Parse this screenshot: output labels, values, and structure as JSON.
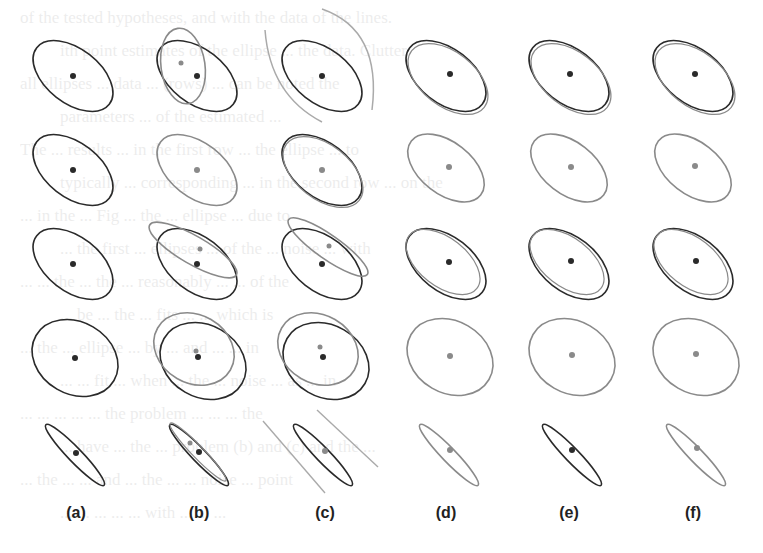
{
  "figure": {
    "column_labels": [
      "(a)",
      "(b)",
      "(c)",
      "(d)",
      "(e)",
      "(f)"
    ],
    "rows": 5,
    "colors": {
      "dark": "#2a2a2a",
      "gray": "#8a8a8a",
      "light_gray": "#aaaaaa"
    }
  },
  "bleed_text": [
    "of the tested hypotheses, and with the data of the lines.",
    "ith point estimates of the ellipse ... the data. Clutter",
    "all ellipses ... data ... (rows) ... can be noted the",
    "parameters ... of the estimated ...",
    "The ... results ... in the first row ... the ellipse ... to",
    "typically ... corresponding ... in the second row ... on the",
    "... in the ... Fig ... the ... ellipse ... due to",
    "... the first ... ellipses ... of the ... noise ... with",
    "... ... the ... the ... reasonably ... ... of the",
    "... be ... the ... fits ... ... which is",
    "... the ... ellipse ... by ... and ... ... in",
    "... ... fit ... when ... the ... noise ... as ... in",
    "... ... ... ... ... the problem ... ... ... the",
    "... have ... the ... problem (b) and (c) and the ...",
    "... the ... ... and ... the ... ... noise ... point",
    "... ... ... ... ... with ... ... ..."
  ]
}
